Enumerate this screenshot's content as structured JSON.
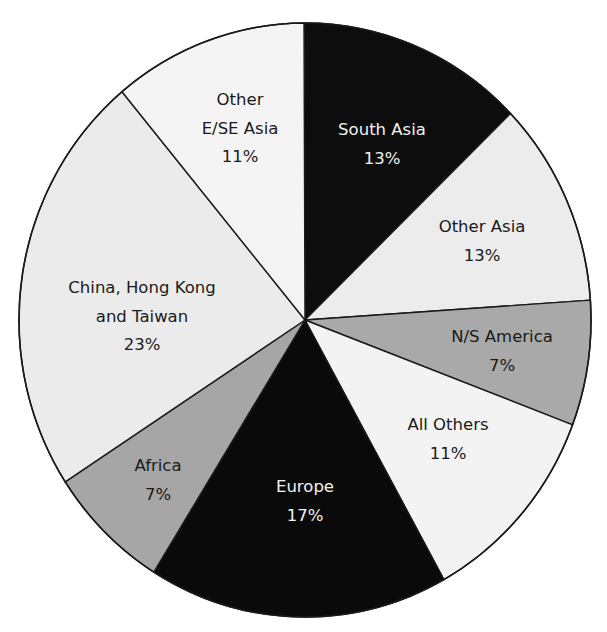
{
  "chart_data": {
    "type": "pie",
    "title": "",
    "start_angle": "12 o'clock, clockwise",
    "slices": [
      {
        "label": "South Asia",
        "value": 13,
        "display": "13%",
        "color": "#0d0d0d",
        "text_color": "#f2f2f2",
        "label_lines": [
          "South Asia"
        ],
        "label_pos": [
          382,
          135
        ]
      },
      {
        "label": "Other Asia",
        "value": 13,
        "display": "13%",
        "color": "#ececec",
        "text_color": "#1a1a1a",
        "label_lines": [
          "Other Asia"
        ],
        "label_pos": [
          482,
          232
        ]
      },
      {
        "label": "N/S America",
        "value": 7,
        "display": "7%",
        "color": "#a9a9a9",
        "text_color": "#1a1a1a",
        "label_lines": [
          "N/S America"
        ],
        "label_pos": [
          502,
          342
        ]
      },
      {
        "label": "All Others",
        "value": 11,
        "display": "11%",
        "color": "#f3f3f3",
        "text_color": "#1a1a1a",
        "label_lines": [
          "All Others"
        ],
        "label_pos": [
          448,
          430
        ]
      },
      {
        "label": "Europe",
        "value": 17,
        "display": "17%",
        "color": "#0a0a0a",
        "text_color": "#f2f2f2",
        "label_lines": [
          "Europe"
        ],
        "label_pos": [
          305,
          492
        ]
      },
      {
        "label": "Africa",
        "value": 7,
        "display": "7%",
        "color": "#a6a6a6",
        "text_color": "#1a1a1a",
        "label_lines": [
          "Africa"
        ],
        "label_pos": [
          158,
          471
        ]
      },
      {
        "label": "China, Hong Kong and Taiwan",
        "value": 23,
        "display": "23%",
        "color": "#ebebeb",
        "text_color": "#1a1a1a",
        "label_lines": [
          "China, Hong Kong",
          "and Taiwan"
        ],
        "label_pos": [
          142,
          293
        ]
      },
      {
        "label": "Other E/SE Asia",
        "value": 11,
        "display": "11%",
        "color": "#f4f4f4",
        "text_color": "#1a1a1a",
        "label_lines": [
          "Other",
          "E/SE Asia"
        ],
        "label_pos": [
          240,
          105
        ]
      }
    ],
    "boundaries": [
      [
        304,
        23
      ],
      [
        511,
        113
      ],
      [
        592,
        300
      ],
      [
        573,
        425
      ],
      [
        443,
        578
      ],
      [
        155,
        570
      ],
      [
        68,
        480
      ],
      [
        123,
        93
      ]
    ],
    "center": [
      305,
      320
    ],
    "radius": [
      286,
      297
    ],
    "legend": "none (labels inside slices)",
    "grid": false
  }
}
